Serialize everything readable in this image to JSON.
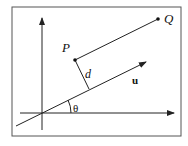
{
  "diagram": {
    "type": "vector-projection-distance",
    "labels": {
      "point_p": "P",
      "point_q": "Q",
      "distance": "d",
      "vector": "u",
      "angle": "θ"
    },
    "colors": {
      "stroke": "#222222",
      "frame": "#555555",
      "background": "#ffffff"
    }
  }
}
